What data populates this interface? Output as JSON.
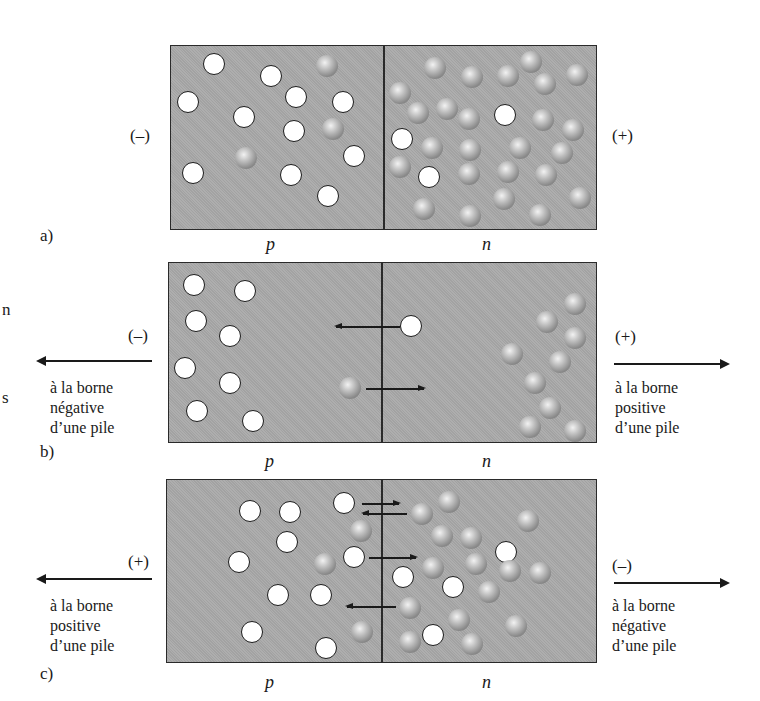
{
  "figure": {
    "colors": {
      "region_fill": "#a9a9a9",
      "border": "#2a2a2a",
      "hole_fill": "#ffffff",
      "electron_fill": "#8a8a8a"
    },
    "edge_fragments": [
      {
        "text": "n",
        "x": 2,
        "y": 300
      },
      {
        "text": "s",
        "x": 2,
        "y": 388
      }
    ],
    "panels": [
      {
        "id": "a",
        "label": "a)",
        "label_pos": [
          40,
          226
        ],
        "box": {
          "x": 170,
          "y": 45,
          "w": 427,
          "h": 185,
          "divider_x": 383
        },
        "region_labels": {
          "p": "p",
          "n": "n",
          "p_pos": [
            266,
            234
          ],
          "n_pos": [
            482,
            234
          ]
        },
        "left_terminal": {
          "sign": "(–)",
          "pos": [
            130,
            126
          ]
        },
        "right_terminal": {
          "sign": "(+)",
          "pos": [
            612,
            126
          ]
        },
        "holes": [
          [
            214,
            64
          ],
          [
            271,
            76
          ],
          [
            188,
            102
          ],
          [
            296,
            97
          ],
          [
            343,
            102
          ],
          [
            244,
            117
          ],
          [
            294,
            131
          ],
          [
            354,
            156
          ],
          [
            193,
            173
          ],
          [
            291,
            175
          ],
          [
            328,
            196
          ],
          [
            402,
            139
          ],
          [
            505,
            115
          ],
          [
            429,
            177
          ]
        ],
        "electrons": [
          [
            327,
            66
          ],
          [
            333,
            129
          ],
          [
            246,
            158
          ],
          [
            435,
            68
          ],
          [
            472,
            77
          ],
          [
            508,
            76
          ],
          [
            531,
            62
          ],
          [
            545,
            84
          ],
          [
            577,
            75
          ],
          [
            400,
            93
          ],
          [
            418,
            113
          ],
          [
            447,
            109
          ],
          [
            469,
            119
          ],
          [
            543,
            120
          ],
          [
            573,
            130
          ],
          [
            432,
            148
          ],
          [
            470,
            150
          ],
          [
            520,
            148
          ],
          [
            562,
            153
          ],
          [
            400,
            167
          ],
          [
            469,
            174
          ],
          [
            508,
            172
          ],
          [
            546,
            175
          ],
          [
            580,
            198
          ],
          [
            424,
            209
          ],
          [
            470,
            216
          ],
          [
            540,
            215
          ],
          [
            504,
            199
          ]
        ],
        "internal_arrows": []
      },
      {
        "id": "b",
        "label": "b)",
        "label_pos": [
          40,
          442
        ],
        "box": {
          "x": 168,
          "y": 262,
          "w": 429,
          "h": 181,
          "divider_x": 381
        },
        "region_labels": {
          "p": "p",
          "n": "n",
          "p_pos": [
            265,
            451
          ],
          "n_pos": [
            482,
            451
          ]
        },
        "left_terminal": {
          "sign": "(–)",
          "pos": [
            128,
            326
          ],
          "arrow": {
            "x1": 38,
            "x2": 152,
            "y": 360,
            "dir": "left"
          },
          "text": [
            "à la borne",
            "négative",
            "d’une pile"
          ],
          "text_pos": [
            50,
            378
          ]
        },
        "right_terminal": {
          "sign": "(+)",
          "pos": [
            615,
            327
          ],
          "arrow": {
            "x1": 614,
            "x2": 728,
            "y": 363,
            "dir": "right"
          },
          "text": [
            "à la borne",
            "positive",
            "d’une pile"
          ],
          "text_pos": [
            615,
            378
          ]
        },
        "holes": [
          [
            194,
            285
          ],
          [
            245,
            291
          ],
          [
            196,
            321
          ],
          [
            230,
            336
          ],
          [
            185,
            368
          ],
          [
            230,
            383
          ],
          [
            197,
            411
          ],
          [
            253,
            421
          ],
          [
            411,
            326
          ]
        ],
        "electrons": [
          [
            350,
            388
          ],
          [
            575,
            304
          ],
          [
            547,
            322
          ],
          [
            575,
            338
          ],
          [
            512,
            354
          ],
          [
            560,
            362
          ],
          [
            535,
            383
          ],
          [
            550,
            408
          ],
          [
            530,
            427
          ],
          [
            575,
            431
          ]
        ],
        "internal_arrows": [
          {
            "x1": 336,
            "x2": 400,
            "y": 326,
            "dir": "left"
          },
          {
            "x1": 366,
            "x2": 424,
            "y": 388,
            "dir": "right"
          }
        ]
      },
      {
        "id": "c",
        "label": "c)",
        "label_pos": [
          40,
          664
        ],
        "box": {
          "x": 166,
          "y": 479,
          "w": 431,
          "h": 184,
          "divider_x": 381
        },
        "region_labels": {
          "p": "p",
          "n": "n",
          "p_pos": [
            265,
            672
          ],
          "n_pos": [
            482,
            672
          ]
        },
        "left_terminal": {
          "sign": "(+)",
          "pos": [
            128,
            552
          ],
          "arrow": {
            "x1": 38,
            "x2": 152,
            "y": 578,
            "dir": "left"
          },
          "text": [
            "à la borne",
            "positive",
            "d’une pile"
          ],
          "text_pos": [
            50,
            596
          ]
        },
        "right_terminal": {
          "sign": "(–)",
          "pos": [
            612,
            556
          ],
          "arrow": {
            "x1": 614,
            "x2": 728,
            "y": 582,
            "dir": "right"
          },
          "text": [
            "à la borne",
            "négative",
            "d’une pile"
          ],
          "text_pos": [
            612,
            596
          ]
        },
        "holes": [
          [
            250,
            511
          ],
          [
            290,
            512
          ],
          [
            344,
            503
          ],
          [
            287,
            542
          ],
          [
            239,
            562
          ],
          [
            354,
            557
          ],
          [
            278,
            595
          ],
          [
            321,
            595
          ],
          [
            403,
            577
          ],
          [
            453,
            587
          ],
          [
            252,
            632
          ],
          [
            433,
            635
          ],
          [
            326,
            648
          ],
          [
            506,
            552
          ]
        ],
        "electrons": [
          [
            361,
            531
          ],
          [
            325,
            564
          ],
          [
            362,
            632
          ],
          [
            449,
            502
          ],
          [
            422,
            514
          ],
          [
            442,
            536
          ],
          [
            471,
            538
          ],
          [
            433,
            568
          ],
          [
            476,
            564
          ],
          [
            510,
            571
          ],
          [
            489,
            592
          ],
          [
            540,
            573
          ],
          [
            410,
            608
          ],
          [
            459,
            620
          ],
          [
            516,
            626
          ],
          [
            410,
            642
          ],
          [
            472,
            644
          ],
          [
            528,
            521
          ]
        ],
        "internal_arrows": [
          {
            "x1": 362,
            "x2": 399,
            "y": 503,
            "dir": "right"
          },
          {
            "x1": 363,
            "x2": 407,
            "y": 513,
            "dir": "left"
          },
          {
            "x1": 369,
            "x2": 416,
            "y": 557,
            "dir": "right"
          },
          {
            "x1": 347,
            "x2": 396,
            "y": 606,
            "dir": "left"
          }
        ]
      }
    ]
  }
}
